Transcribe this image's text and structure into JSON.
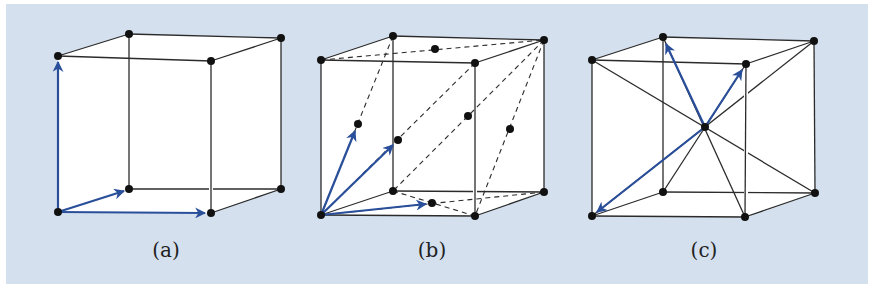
{
  "figure": {
    "background_color": "#d4e0ee",
    "vector_color": "#2a4f9a",
    "edge_color": "#2b2b2b",
    "atom_color": "#111111",
    "panels": [
      {
        "id": "a",
        "label": "(a)",
        "lattice": "simple cubic",
        "primitive_vectors": 3,
        "atoms": 8
      },
      {
        "id": "b",
        "label": "(b)",
        "lattice": "face-centered cubic",
        "primitive_vectors": 3,
        "atoms": 14
      },
      {
        "id": "c",
        "label": "(c)",
        "lattice": "body-centered cubic",
        "primitive_vectors": 3,
        "atoms": 9
      }
    ]
  }
}
